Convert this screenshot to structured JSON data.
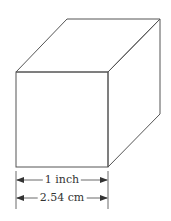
{
  "diagram": {
    "shape": "cube",
    "line_color": "#555555",
    "vertices": {
      "front_top_left": [
        16,
        72
      ],
      "front_top_right": [
        108,
        72
      ],
      "front_bottom_left": [
        16,
        167
      ],
      "front_bottom_right": [
        108,
        167
      ],
      "back_top_left": [
        67,
        19
      ],
      "back_top_right": [
        160,
        19
      ],
      "back_bottom_right": [
        160,
        114
      ]
    },
    "dimensions": [
      {
        "label": "1 inch",
        "y": 180,
        "x_start": 16,
        "x_end": 108
      },
      {
        "label": "2.54 cm",
        "y": 198,
        "x_start": 16,
        "x_end": 108
      }
    ]
  }
}
